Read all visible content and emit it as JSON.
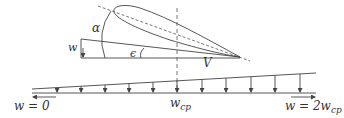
{
  "diagram": {
    "title": "",
    "colors": {
      "stroke": "#444444",
      "text": "#333333",
      "background": "#ffffff"
    },
    "labels": {
      "alpha": "α",
      "epsilon": "ϵ",
      "w_left": "w",
      "V": "V",
      "w_cp_base": "w",
      "w_cp_sub": "cp",
      "w_zero": "w = 0",
      "w_two_base": "w = 2w",
      "w_two_sub": "cp"
    },
    "downwash_arrows_count": 11
  }
}
